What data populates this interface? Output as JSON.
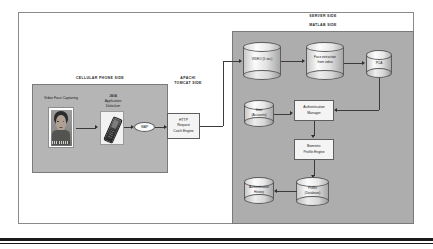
{
  "figure": {
    "regions": {
      "server_side": "SERVER SIDE",
      "matlab_side": "MATLAB SIDE",
      "phone_side": "CELLULAR PHONE SIDE",
      "apachi_side": "APACHI\nTOMCAT SIDE"
    },
    "phone": {
      "photo_caption": "Video Face Capturing",
      "java_label": "JAVA\nApplication\nDoloclum",
      "wap_label": "WAP"
    },
    "tomcat": {
      "http_box": "HTTP\nRequest\nCatch Engine"
    },
    "server": {
      "video_db": "VIDEO (5 sec)",
      "extract_db": "Face extraction\nfrom video",
      "pca_db": "PCA",
      "user_db": "User\n(Accounts)",
      "auth_manager": "Authentication\nManager",
      "bio_engine": "Biometric\nProfile Engine",
      "history_db": "Authentication\nHistory",
      "profile_db": "Profile\n(Database)"
    },
    "colors": {
      "server_panel": "#adadad",
      "phone_panel": "#b5b5b5",
      "box_fill": "#f4f4f4",
      "line": "#3b3b3b"
    }
  }
}
